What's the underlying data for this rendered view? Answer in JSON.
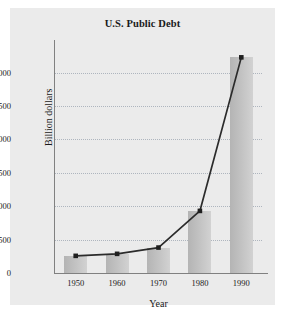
{
  "chart_data": {
    "type": "bar",
    "title": "U.S. Public Debt",
    "xlabel": "Year",
    "ylabel": "Billion dollars",
    "categories": [
      "1950",
      "1960",
      "1970",
      "1980",
      "1990"
    ],
    "values": [
      257,
      287,
      381,
      930,
      3230
    ],
    "series": [
      {
        "name": "U.S. Public Debt",
        "values": [
          257,
          287,
          381,
          930,
          3230
        ]
      }
    ],
    "yticks": [
      "0",
      "500",
      "1,000",
      "1,500",
      "2,000",
      "2,500",
      "3,000"
    ],
    "ytick_values": [
      0,
      500,
      1000,
      1500,
      2000,
      2500,
      3000
    ],
    "ylim": [
      0,
      3400
    ],
    "xticks": [
      "1950",
      "1960",
      "1970",
      "1980",
      "1990"
    ],
    "grid": "horizontal-dotted",
    "legend": "none",
    "overlay": "line-with-square-markers",
    "colors": {
      "bar_fill": "#c4c4c4",
      "line": "#2b2b2b",
      "marker": "#1f1f1f",
      "grid": "#9aa3b0",
      "axis": "#808080",
      "panel_background": "#ebebeb",
      "page_background": "#ffffff",
      "text": "#1a1a1a"
    }
  }
}
